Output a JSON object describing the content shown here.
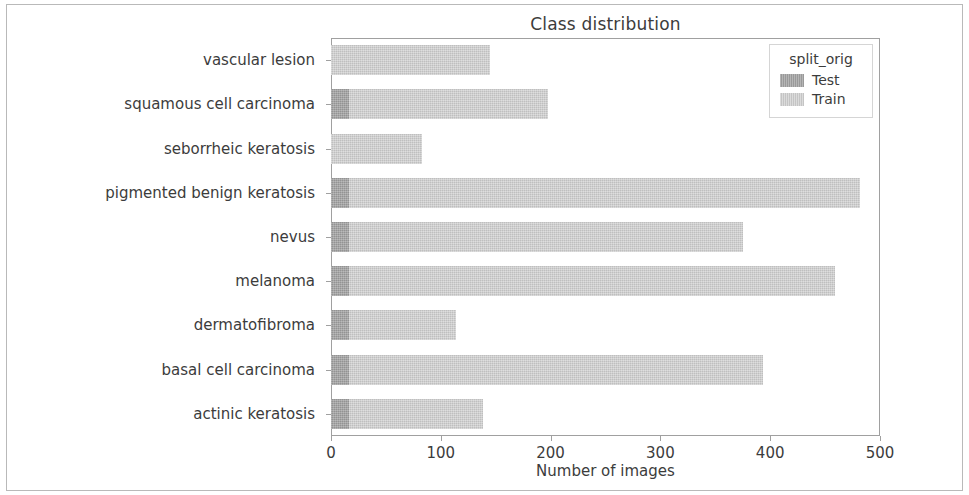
{
  "chart_data": {
    "type": "bar",
    "orientation": "horizontal",
    "stacked": true,
    "title": "Class distribution",
    "xlabel": "Number of images",
    "ylabel": "Skin lesion type",
    "xlim": [
      0,
      500
    ],
    "ylim_categories": 9,
    "grid": false,
    "legend_position": "upper right",
    "legend_title": "split_orig",
    "xticks": [
      0,
      100,
      200,
      300,
      400,
      500
    ],
    "xtick_labels": [
      "0",
      "100",
      "200",
      "300",
      "400",
      "500"
    ],
    "categories": [
      "vascular lesion",
      "squamous cell carcinoma",
      "seborrheic keratosis",
      "pigmented benign keratosis",
      "nevus",
      "melanoma",
      "dermatofibroma",
      "basal cell carcinoma",
      "actinic keratosis"
    ],
    "series": [
      {
        "name": "Test",
        "color": "#a3a3a3",
        "values": [
          0,
          16,
          0,
          16,
          16,
          16,
          16,
          16,
          16
        ]
      },
      {
        "name": "Train",
        "color": "#cfcfcf",
        "values": [
          145,
          182,
          83,
          466,
          359,
          443,
          98,
          377,
          122
        ]
      }
    ],
    "totals": [
      145,
      198,
      83,
      482,
      375,
      459,
      114,
      393,
      138
    ]
  },
  "chart": {
    "title": "Class distribution",
    "xaxis_title": "Number of images",
    "yaxis_title": "Skin lesion type"
  },
  "legend": {
    "title": "split_orig",
    "items": [
      {
        "label": "Test",
        "color": "#a3a3a3"
      },
      {
        "label": "Train",
        "color": "#cfcfcf"
      }
    ]
  }
}
